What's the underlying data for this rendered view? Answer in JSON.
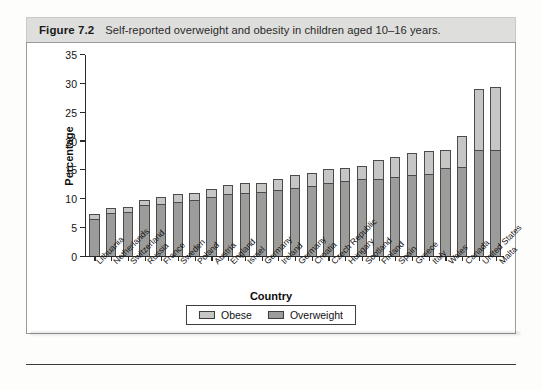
{
  "figure": {
    "number": "Figure 7.2",
    "caption": "Self-reported overweight and obesity in children aged 10–16 years."
  },
  "chart_data": {
    "type": "bar",
    "subtype": "stacked-vertical",
    "title": "Self-reported overweight and obesity in children aged 10–16 years.",
    "xlabel": "Country",
    "ylabel": "Percentage",
    "ylim": [
      0,
      35
    ],
    "yticks": [
      0,
      5,
      10,
      15,
      20,
      25,
      30,
      35
    ],
    "grid": false,
    "legend_position": "bottom-center",
    "categories": [
      "Lithuania",
      "Netherlands",
      "Switzerland",
      "Russia",
      "France",
      "Sweden",
      "Poland",
      "Austria",
      "England",
      "Israel",
      "Germany",
      "Ireland",
      "Germany",
      "Croatia",
      "Czech Republic",
      "Hungary",
      "Scotland",
      "Finland",
      "Spain",
      "Greece",
      "Italy",
      "Wales",
      "Canada",
      "United States",
      "Malta"
    ],
    "series": [
      {
        "name": "Overweight",
        "color": "#9c9c9a",
        "values": [
          6.4,
          7.3,
          7.6,
          8.8,
          9.0,
          9.3,
          9.6,
          10.2,
          10.6,
          10.8,
          11.1,
          11.4,
          11.8,
          12.1,
          12.6,
          13.0,
          13.2,
          13.3,
          13.6,
          13.9,
          14.2,
          15.2,
          15.3,
          18.3,
          18.3
        ]
      },
      {
        "name": "Obese",
        "color": "#c6c6c4",
        "values": [
          0.8,
          0.9,
          0.9,
          0.8,
          1.1,
          1.3,
          1.3,
          1.4,
          1.7,
          1.8,
          1.4,
          1.9,
          2.1,
          2.2,
          2.4,
          2.2,
          2.4,
          3.3,
          3.5,
          3.9,
          3.9,
          3.1,
          5.5,
          10.5,
          11.0
        ]
      }
    ],
    "totals": [
      7.2,
      8.2,
      8.5,
      9.6,
      10.1,
      10.6,
      10.9,
      11.6,
      12.3,
      12.6,
      12.5,
      13.3,
      13.9,
      14.3,
      15.0,
      15.2,
      15.6,
      16.6,
      17.1,
      17.8,
      18.1,
      18.3,
      20.8,
      28.8,
      29.3
    ]
  },
  "legend": {
    "items": [
      {
        "label": "Obese",
        "color": "#c6c6c4"
      },
      {
        "label": "Overweight",
        "color": "#9c9c9a"
      }
    ]
  }
}
